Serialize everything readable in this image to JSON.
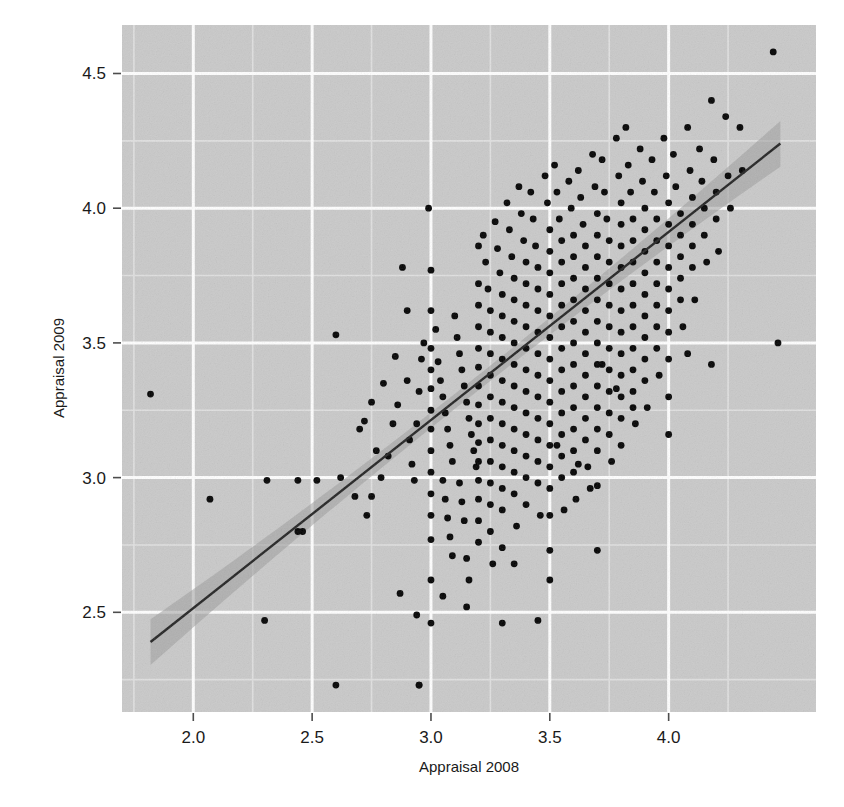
{
  "chart_data": {
    "type": "scatter",
    "title": "",
    "subtitle": "",
    "xlabel": "Appraisal 2008",
    "ylabel": "Appraisal 2009",
    "xlim": [
      1.7,
      4.62
    ],
    "ylim": [
      2.13,
      4.68
    ],
    "xticks": [
      2.0,
      2.5,
      3.0,
      3.5,
      4.0
    ],
    "xtick_labels": [
      "2.0",
      "2.5",
      "3.0",
      "3.5",
      "4.0"
    ],
    "yticks": [
      2.5,
      3.0,
      3.5,
      4.0,
      4.5
    ],
    "ytick_labels": [
      "2.5",
      "3.0",
      "3.5",
      "4.0",
      "4.5"
    ],
    "minor_xticks": [
      1.75,
      2.25,
      2.75,
      3.25,
      3.75,
      4.25
    ],
    "minor_yticks": [
      2.25,
      2.75,
      3.25,
      3.75,
      4.25
    ],
    "grid": true,
    "legend": "none",
    "panel_background": "#c9c9c9",
    "grid_major_color": "#ffffff",
    "grid_minor_color": "#e3e3e3",
    "point_color": "#000000",
    "point_size": 3.4,
    "fit_line_color": "#222222",
    "fit_band_color": "#9a9a9a",
    "fit_line": {
      "type": "linear-smooth",
      "x_start": 1.82,
      "y_start": 2.39,
      "x_end": 4.47,
      "y_end": 4.24,
      "slope": 0.698,
      "intercept": 1.119,
      "band_halfwidth_center": 0.028,
      "band_halfwidth_edge": 0.085
    },
    "points": [
      [
        1.82,
        3.31
      ],
      [
        2.07,
        2.92
      ],
      [
        2.31,
        2.99
      ],
      [
        2.3,
        2.47
      ],
      [
        2.44,
        2.99
      ],
      [
        2.52,
        2.99
      ],
      [
        2.44,
        2.8
      ],
      [
        2.46,
        2.8
      ],
      [
        2.6,
        3.53
      ],
      [
        2.6,
        2.23
      ],
      [
        2.62,
        3.0
      ],
      [
        2.68,
        2.93
      ],
      [
        2.72,
        3.21
      ],
      [
        2.73,
        2.86
      ],
      [
        2.75,
        2.93
      ],
      [
        2.77,
        3.1
      ],
      [
        2.79,
        3.0
      ],
      [
        2.82,
        3.08
      ],
      [
        2.84,
        3.2
      ],
      [
        2.86,
        3.27
      ],
      [
        2.87,
        2.57
      ],
      [
        2.88,
        3.78
      ],
      [
        2.9,
        3.36
      ],
      [
        2.91,
        3.14
      ],
      [
        2.92,
        3.05
      ],
      [
        2.93,
        2.99
      ],
      [
        2.94,
        3.2
      ],
      [
        2.95,
        3.32
      ],
      [
        2.96,
        3.44
      ],
      [
        2.97,
        3.5
      ],
      [
        2.94,
        2.49
      ],
      [
        2.95,
        2.23
      ],
      [
        2.99,
        4.0
      ],
      [
        3.0,
        3.77
      ],
      [
        3.0,
        3.62
      ],
      [
        3.0,
        3.48
      ],
      [
        3.0,
        3.4
      ],
      [
        3.0,
        3.33
      ],
      [
        3.0,
        3.25
      ],
      [
        3.0,
        3.18
      ],
      [
        3.0,
        3.1
      ],
      [
        3.0,
        3.02
      ],
      [
        3.0,
        2.94
      ],
      [
        3.0,
        2.86
      ],
      [
        3.0,
        2.77
      ],
      [
        3.0,
        2.62
      ],
      [
        3.0,
        2.46
      ],
      [
        3.02,
        3.55
      ],
      [
        3.03,
        3.43
      ],
      [
        3.04,
        3.36
      ],
      [
        3.05,
        3.3
      ],
      [
        3.06,
        3.24
      ],
      [
        3.07,
        3.18
      ],
      [
        3.08,
        3.12
      ],
      [
        3.09,
        3.06
      ],
      [
        3.05,
        2.99
      ],
      [
        3.06,
        2.92
      ],
      [
        3.07,
        2.85
      ],
      [
        3.08,
        2.78
      ],
      [
        3.09,
        2.71
      ],
      [
        3.1,
        3.6
      ],
      [
        3.11,
        3.52
      ],
      [
        3.12,
        3.46
      ],
      [
        3.13,
        3.4
      ],
      [
        3.14,
        3.34
      ],
      [
        3.15,
        3.28
      ],
      [
        3.16,
        3.22
      ],
      [
        3.17,
        3.16
      ],
      [
        3.18,
        3.1
      ],
      [
        3.19,
        3.04
      ],
      [
        3.12,
        2.98
      ],
      [
        3.13,
        2.91
      ],
      [
        3.14,
        2.84
      ],
      [
        3.15,
        2.7
      ],
      [
        3.16,
        2.62
      ],
      [
        3.2,
        3.86
      ],
      [
        3.2,
        3.72
      ],
      [
        3.2,
        3.64
      ],
      [
        3.2,
        3.56
      ],
      [
        3.2,
        3.48
      ],
      [
        3.2,
        3.41
      ],
      [
        3.2,
        3.34
      ],
      [
        3.2,
        3.27
      ],
      [
        3.2,
        3.2
      ],
      [
        3.2,
        3.13
      ],
      [
        3.2,
        3.06
      ],
      [
        3.2,
        2.99
      ],
      [
        3.2,
        2.92
      ],
      [
        3.2,
        2.84
      ],
      [
        3.2,
        2.76
      ],
      [
        3.22,
        3.9
      ],
      [
        3.23,
        3.8
      ],
      [
        3.24,
        3.7
      ],
      [
        3.25,
        3.62
      ],
      [
        3.25,
        3.54
      ],
      [
        3.25,
        3.46
      ],
      [
        3.25,
        3.38
      ],
      [
        3.25,
        3.3
      ],
      [
        3.25,
        3.22
      ],
      [
        3.25,
        3.14
      ],
      [
        3.25,
        3.06
      ],
      [
        3.25,
        2.98
      ],
      [
        3.25,
        2.9
      ],
      [
        3.25,
        2.8
      ],
      [
        3.26,
        2.68
      ],
      [
        3.27,
        3.95
      ],
      [
        3.28,
        3.85
      ],
      [
        3.29,
        3.76
      ],
      [
        3.3,
        3.68
      ],
      [
        3.3,
        3.6
      ],
      [
        3.3,
        3.52
      ],
      [
        3.3,
        3.44
      ],
      [
        3.3,
        3.36
      ],
      [
        3.3,
        3.28
      ],
      [
        3.3,
        3.2
      ],
      [
        3.3,
        3.12
      ],
      [
        3.3,
        3.04
      ],
      [
        3.3,
        2.96
      ],
      [
        3.3,
        2.88
      ],
      [
        3.3,
        2.74
      ],
      [
        3.32,
        4.02
      ],
      [
        3.33,
        3.92
      ],
      [
        3.34,
        3.82
      ],
      [
        3.35,
        3.74
      ],
      [
        3.35,
        3.66
      ],
      [
        3.35,
        3.58
      ],
      [
        3.35,
        3.5
      ],
      [
        3.35,
        3.42
      ],
      [
        3.35,
        3.34
      ],
      [
        3.35,
        3.26
      ],
      [
        3.35,
        3.18
      ],
      [
        3.35,
        3.1
      ],
      [
        3.35,
        3.02
      ],
      [
        3.35,
        2.94
      ],
      [
        3.36,
        2.82
      ],
      [
        3.37,
        4.08
      ],
      [
        3.38,
        3.98
      ],
      [
        3.39,
        3.88
      ],
      [
        3.4,
        3.8
      ],
      [
        3.4,
        3.72
      ],
      [
        3.4,
        3.64
      ],
      [
        3.4,
        3.56
      ],
      [
        3.4,
        3.48
      ],
      [
        3.4,
        3.4
      ],
      [
        3.4,
        3.32
      ],
      [
        3.4,
        3.24
      ],
      [
        3.4,
        3.16
      ],
      [
        3.4,
        3.08
      ],
      [
        3.4,
        3.0
      ],
      [
        3.4,
        2.9
      ],
      [
        3.42,
        4.06
      ],
      [
        3.43,
        3.96
      ],
      [
        3.44,
        3.86
      ],
      [
        3.45,
        3.78
      ],
      [
        3.45,
        3.7
      ],
      [
        3.45,
        3.62
      ],
      [
        3.45,
        3.54
      ],
      [
        3.45,
        3.46
      ],
      [
        3.45,
        3.38
      ],
      [
        3.45,
        3.3
      ],
      [
        3.45,
        3.22
      ],
      [
        3.45,
        3.14
      ],
      [
        3.45,
        3.06
      ],
      [
        3.45,
        2.98
      ],
      [
        3.46,
        2.86
      ],
      [
        3.48,
        4.12
      ],
      [
        3.49,
        4.02
      ],
      [
        3.5,
        3.92
      ],
      [
        3.5,
        3.84
      ],
      [
        3.5,
        3.76
      ],
      [
        3.5,
        3.68
      ],
      [
        3.5,
        3.6
      ],
      [
        3.5,
        3.52
      ],
      [
        3.5,
        3.44
      ],
      [
        3.5,
        3.36
      ],
      [
        3.5,
        3.28
      ],
      [
        3.5,
        3.2
      ],
      [
        3.5,
        3.12
      ],
      [
        3.5,
        3.04
      ],
      [
        3.5,
        2.96
      ],
      [
        3.5,
        2.86
      ],
      [
        3.5,
        2.73
      ],
      [
        3.52,
        4.16
      ],
      [
        3.53,
        4.06
      ],
      [
        3.54,
        3.96
      ],
      [
        3.55,
        3.88
      ],
      [
        3.55,
        3.8
      ],
      [
        3.55,
        3.72
      ],
      [
        3.55,
        3.64
      ],
      [
        3.55,
        3.56
      ],
      [
        3.55,
        3.48
      ],
      [
        3.55,
        3.4
      ],
      [
        3.55,
        3.32
      ],
      [
        3.55,
        3.24
      ],
      [
        3.55,
        3.16
      ],
      [
        3.55,
        3.08
      ],
      [
        3.55,
        3.0
      ],
      [
        3.56,
        2.88
      ],
      [
        3.58,
        4.1
      ],
      [
        3.59,
        4.0
      ],
      [
        3.6,
        3.9
      ],
      [
        3.6,
        3.82
      ],
      [
        3.6,
        3.74
      ],
      [
        3.6,
        3.66
      ],
      [
        3.6,
        3.58
      ],
      [
        3.6,
        3.5
      ],
      [
        3.6,
        3.42
      ],
      [
        3.6,
        3.34
      ],
      [
        3.6,
        3.26
      ],
      [
        3.6,
        3.18
      ],
      [
        3.6,
        3.1
      ],
      [
        3.6,
        3.02
      ],
      [
        3.61,
        2.92
      ],
      [
        3.62,
        4.14
      ],
      [
        3.63,
        4.04
      ],
      [
        3.64,
        3.94
      ],
      [
        3.65,
        3.86
      ],
      [
        3.65,
        3.78
      ],
      [
        3.65,
        3.7
      ],
      [
        3.65,
        3.62
      ],
      [
        3.65,
        3.54
      ],
      [
        3.65,
        3.46
      ],
      [
        3.65,
        3.38
      ],
      [
        3.65,
        3.3
      ],
      [
        3.65,
        3.22
      ],
      [
        3.65,
        3.14
      ],
      [
        3.66,
        3.04
      ],
      [
        3.67,
        2.96
      ],
      [
        3.68,
        4.2
      ],
      [
        3.69,
        4.08
      ],
      [
        3.7,
        3.98
      ],
      [
        3.7,
        3.9
      ],
      [
        3.7,
        3.82
      ],
      [
        3.7,
        3.74
      ],
      [
        3.7,
        3.66
      ],
      [
        3.7,
        3.58
      ],
      [
        3.7,
        3.5
      ],
      [
        3.7,
        3.42
      ],
      [
        3.7,
        3.34
      ],
      [
        3.7,
        3.26
      ],
      [
        3.7,
        3.18
      ],
      [
        3.7,
        3.1
      ],
      [
        3.7,
        2.97
      ],
      [
        3.7,
        2.73
      ],
      [
        3.72,
        4.18
      ],
      [
        3.73,
        4.06
      ],
      [
        3.74,
        3.96
      ],
      [
        3.75,
        3.88
      ],
      [
        3.75,
        3.8
      ],
      [
        3.75,
        3.72
      ],
      [
        3.75,
        3.64
      ],
      [
        3.75,
        3.56
      ],
      [
        3.75,
        3.48
      ],
      [
        3.75,
        3.4
      ],
      [
        3.75,
        3.32
      ],
      [
        3.75,
        3.24
      ],
      [
        3.75,
        3.16
      ],
      [
        3.76,
        3.06
      ],
      [
        3.78,
        4.26
      ],
      [
        3.79,
        4.12
      ],
      [
        3.8,
        4.02
      ],
      [
        3.8,
        3.94
      ],
      [
        3.8,
        3.86
      ],
      [
        3.8,
        3.78
      ],
      [
        3.8,
        3.7
      ],
      [
        3.8,
        3.62
      ],
      [
        3.8,
        3.54
      ],
      [
        3.8,
        3.46
      ],
      [
        3.8,
        3.38
      ],
      [
        3.8,
        3.3
      ],
      [
        3.8,
        3.22
      ],
      [
        3.8,
        3.12
      ],
      [
        3.82,
        4.3
      ],
      [
        3.83,
        4.16
      ],
      [
        3.84,
        4.06
      ],
      [
        3.85,
        3.96
      ],
      [
        3.85,
        3.88
      ],
      [
        3.85,
        3.8
      ],
      [
        3.85,
        3.72
      ],
      [
        3.85,
        3.64
      ],
      [
        3.85,
        3.56
      ],
      [
        3.85,
        3.48
      ],
      [
        3.85,
        3.4
      ],
      [
        3.85,
        3.32
      ],
      [
        3.86,
        3.2
      ],
      [
        3.88,
        4.22
      ],
      [
        3.89,
        4.1
      ],
      [
        3.9,
        4.0
      ],
      [
        3.9,
        3.92
      ],
      [
        3.9,
        3.84
      ],
      [
        3.9,
        3.76
      ],
      [
        3.9,
        3.68
      ],
      [
        3.9,
        3.6
      ],
      [
        3.9,
        3.52
      ],
      [
        3.9,
        3.44
      ],
      [
        3.9,
        3.36
      ],
      [
        3.91,
        3.26
      ],
      [
        3.93,
        4.18
      ],
      [
        3.94,
        4.06
      ],
      [
        3.95,
        3.96
      ],
      [
        3.95,
        3.88
      ],
      [
        3.95,
        3.8
      ],
      [
        3.95,
        3.72
      ],
      [
        3.95,
        3.64
      ],
      [
        3.95,
        3.56
      ],
      [
        3.95,
        3.48
      ],
      [
        3.96,
        3.38
      ],
      [
        3.98,
        4.26
      ],
      [
        3.99,
        4.12
      ],
      [
        4.0,
        4.02
      ],
      [
        4.0,
        3.94
      ],
      [
        4.0,
        3.86
      ],
      [
        4.0,
        3.78
      ],
      [
        4.0,
        3.7
      ],
      [
        4.0,
        3.62
      ],
      [
        4.0,
        3.54
      ],
      [
        4.0,
        3.44
      ],
      [
        4.0,
        3.3
      ],
      [
        4.02,
        4.2
      ],
      [
        4.03,
        4.08
      ],
      [
        4.05,
        3.98
      ],
      [
        4.05,
        3.9
      ],
      [
        4.05,
        3.82
      ],
      [
        4.05,
        3.74
      ],
      [
        4.05,
        3.66
      ],
      [
        4.06,
        3.56
      ],
      [
        4.08,
        4.3
      ],
      [
        4.09,
        4.14
      ],
      [
        4.1,
        4.04
      ],
      [
        4.1,
        3.94
      ],
      [
        4.1,
        3.86
      ],
      [
        4.1,
        3.78
      ],
      [
        4.11,
        3.66
      ],
      [
        4.13,
        4.22
      ],
      [
        4.14,
        4.1
      ],
      [
        4.15,
        4.0
      ],
      [
        4.15,
        3.9
      ],
      [
        4.16,
        3.8
      ],
      [
        4.18,
        4.4
      ],
      [
        4.19,
        4.18
      ],
      [
        4.2,
        4.06
      ],
      [
        4.2,
        3.96
      ],
      [
        4.21,
        3.84
      ],
      [
        4.24,
        4.34
      ],
      [
        4.25,
        4.12
      ],
      [
        4.26,
        4.0
      ],
      [
        4.3,
        4.3
      ],
      [
        4.31,
        4.14
      ],
      [
        4.44,
        4.58
      ],
      [
        4.46,
        3.5
      ],
      [
        3.3,
        2.46
      ],
      [
        3.45,
        2.47
      ],
      [
        3.05,
        2.56
      ],
      [
        2.95,
        2.23
      ],
      [
        3.53,
        3.12
      ],
      [
        3.62,
        3.05
      ],
      [
        3.72,
        3.42
      ],
      [
        3.78,
        3.33
      ],
      [
        3.85,
        3.26
      ],
      [
        4.0,
        3.16
      ],
      [
        4.08,
        3.46
      ],
      [
        4.18,
        3.42
      ],
      [
        3.35,
        2.68
      ],
      [
        3.5,
        2.62
      ],
      [
        3.15,
        2.52
      ],
      [
        2.85,
        3.45
      ],
      [
        2.9,
        3.62
      ],
      [
        2.8,
        3.35
      ],
      [
        2.75,
        3.28
      ],
      [
        2.7,
        3.18
      ]
    ]
  }
}
